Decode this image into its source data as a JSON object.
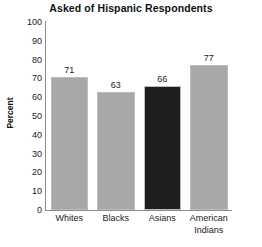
{
  "chart_data": {
    "type": "bar",
    "title": "Asked of Hispanic Respondents",
    "xlabel": "",
    "ylabel": "Percent",
    "ylim": [
      0,
      100
    ],
    "yticks": [
      "100",
      "90",
      "80",
      "70",
      "60",
      "50",
      "40",
      "30",
      "20",
      "10",
      "0"
    ],
    "grid": false,
    "legend": "none",
    "categories": [
      "Whites",
      "Blacks",
      "Asians",
      "American Indians"
    ],
    "category_lines": [
      [
        "Whites"
      ],
      [
        "Blacks"
      ],
      [
        "Asians"
      ],
      [
        "American",
        "Indians"
      ]
    ],
    "values": [
      71,
      63,
      66,
      77
    ],
    "value_labels": [
      "71",
      "63",
      "66",
      "77"
    ],
    "bar_colors": [
      "#a8a8a8",
      "#a8a8a8",
      "#1e1e1e",
      "#a8a8a8"
    ],
    "axis_color": "#8c8c8c",
    "background": "#ffffff"
  }
}
